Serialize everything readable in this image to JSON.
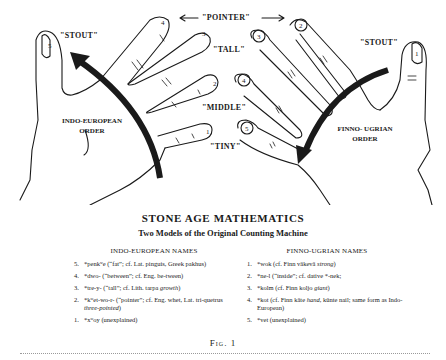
{
  "figure": {
    "labels": {
      "pointer": "\"POINTER\"",
      "stout_left": "\"STOUT\"",
      "stout_right": "\"STOUT\"",
      "tall": "\"TALL\"",
      "middle": "\"MIDDLE\"",
      "tiny": "\"TINY\"",
      "ie_order_line1": "INDO-EUROPEAN",
      "ie_order_line2": "ORDER",
      "fu_order_line1": "FINNO- UGRIAN",
      "fu_order_line2": "ORDER"
    },
    "left_hand_finger_numbers": [
      "5",
      "4",
      "3",
      "2",
      "1"
    ],
    "right_hand_finger_numbers": [
      "1",
      "2",
      "3",
      "4",
      "5"
    ]
  },
  "title": "STONE AGE MATHEMATICS",
  "subtitle": "Two Models of the Original Counting Machine",
  "indo_european": {
    "heading": "INDO-EUROPEAN NAMES",
    "entries": [
      {
        "num": "5.",
        "text": "*penkʷe (“fat”; cf. Lat. pinguis, Greek pakhus)"
      },
      {
        "num": "4.",
        "text": "*dwo- (“between”; cf. Eng. be-tween)"
      },
      {
        "num": "3.",
        "text": "*tre-y- (“tall”; cf. Lith. tarpa ",
        "italic": "growth",
        "tail": ")"
      },
      {
        "num": "2.",
        "text": "*kʷet-wo-r- (“pointer”; cf. Eng. whet, Lat. tri-quetrus ",
        "italic": "three-pointed",
        "tail": ")"
      },
      {
        "num": "1.",
        "text": "*xʷoy (unexplained)"
      }
    ]
  },
  "finno_ugrian": {
    "heading": "FINNO-UGRIAN NAMES",
    "entries": [
      {
        "num": "1.",
        "text": "*wok (cf. Finn väkevä ",
        "italic": "strong",
        "tail": ")"
      },
      {
        "num": "2.",
        "text": "*ne-l (“inside”; cf. dative *-nek;"
      },
      {
        "num": "3.",
        "text": "*kolm (cf. Finn koljo ",
        "italic": "giant",
        "tail": ")"
      },
      {
        "num": "4.",
        "text": "*kot (cf. Finn käte ",
        "italic": "hand",
        "tail": ", künte nail; same form as Indo-European)"
      },
      {
        "num": "5.",
        "text": "*vet (unexplained)"
      }
    ]
  },
  "caption": "Fig. 1"
}
